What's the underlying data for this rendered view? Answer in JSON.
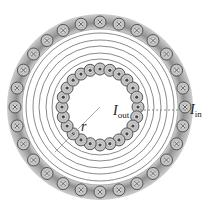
{
  "diagram": {
    "type": "toroid-cross-section",
    "center": [
      100,
      107
    ],
    "outer_ring": {
      "inner_radius": 78,
      "outer_radius": 93,
      "wire_radius": 85,
      "wire_count": 28,
      "wire_symbol": "cross",
      "color": "#8c8c8c"
    },
    "inner_ring": {
      "wire_radius": 38,
      "wire_count": 24,
      "wire_symbol": "dot"
    },
    "wire_size": 6,
    "field_lines": [
      48,
      54,
      61,
      67,
      74
    ],
    "labels": {
      "r": "r",
      "i_out_main": "I",
      "i_out_sub": "out",
      "i_in_main": "I",
      "i_in_sub": "in"
    }
  }
}
